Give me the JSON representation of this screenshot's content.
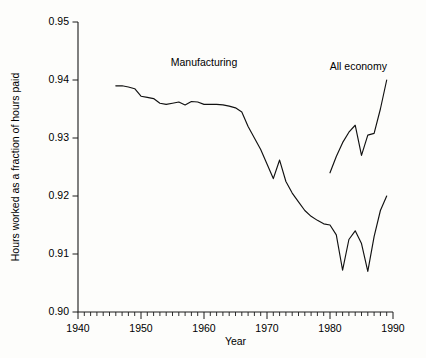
{
  "chart_data": {
    "type": "line",
    "title": "",
    "xlabel": "Year",
    "ylabel": "Hours worked as a fraction of hours paid",
    "xlim": [
      1940,
      1990
    ],
    "ylim": [
      0.9,
      0.95
    ],
    "grid": false,
    "legend_position": "inline-annotation",
    "x_ticks": [
      1940,
      1950,
      1960,
      1970,
      1980,
      1990
    ],
    "x_tick_labels": [
      "1940",
      "1950",
      "1960",
      "1970",
      "1980",
      "1990"
    ],
    "x_minor_tick_step": 1,
    "y_ticks": [
      0.9,
      0.91,
      0.92,
      0.93,
      0.94,
      0.95
    ],
    "y_tick_labels": [
      "0.90",
      "0.91",
      "0.92",
      "0.93",
      "0.94",
      "0.95"
    ],
    "series": [
      {
        "name": "Manufacturing",
        "label_x": 1960,
        "label_y": 0.9425,
        "x": [
          1946,
          1947,
          1948,
          1949,
          1950,
          1951,
          1952,
          1953,
          1954,
          1955,
          1956,
          1957,
          1958,
          1959,
          1960,
          1961,
          1962,
          1963,
          1964,
          1965,
          1966,
          1967,
          1968,
          1969,
          1970,
          1971,
          1972,
          1973,
          1974,
          1975,
          1976,
          1977,
          1978,
          1979,
          1980,
          1981,
          1982,
          1983,
          1984,
          1985,
          1986,
          1987,
          1988,
          1989
        ],
        "values": [
          0.939,
          0.939,
          0.9388,
          0.9385,
          0.9372,
          0.937,
          0.9368,
          0.936,
          0.9358,
          0.936,
          0.9362,
          0.9357,
          0.9363,
          0.9362,
          0.9358,
          0.9358,
          0.9358,
          0.9357,
          0.9355,
          0.9352,
          0.9345,
          0.932,
          0.93,
          0.928,
          0.9255,
          0.923,
          0.9262,
          0.9225,
          0.9205,
          0.919,
          0.9175,
          0.9165,
          0.9158,
          0.9152,
          0.915,
          0.9133,
          0.9072,
          0.9125,
          0.914,
          0.9118,
          0.907,
          0.913,
          0.9175,
          0.92
        ]
      },
      {
        "name": "All economy",
        "label_x": 1984.5,
        "label_y": 0.9418,
        "x": [
          1980,
          1981,
          1982,
          1983,
          1984,
          1985,
          1986,
          1987,
          1988,
          1989
        ],
        "values": [
          0.924,
          0.9268,
          0.9292,
          0.931,
          0.9322,
          0.927,
          0.9305,
          0.9308,
          0.935,
          0.94
        ]
      }
    ]
  }
}
